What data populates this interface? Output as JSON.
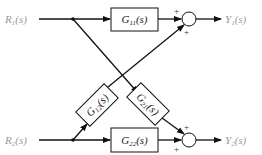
{
  "diagram": {
    "type": "block-diagram",
    "inputs": [
      {
        "id": "R1",
        "label": "R1(s)"
      },
      {
        "id": "R2",
        "label": "R2(s)"
      }
    ],
    "outputs": [
      {
        "id": "Y1",
        "label": "Y1(s)"
      },
      {
        "id": "Y2",
        "label": "Y2(s)"
      }
    ],
    "blocks": [
      {
        "id": "G11",
        "label": "G11(s)"
      },
      {
        "id": "G12",
        "label": "G12(s)"
      },
      {
        "id": "G21",
        "label": "G21(s)"
      },
      {
        "id": "G22",
        "label": "G22(s)"
      }
    ],
    "summing_junctions": [
      {
        "id": "S1",
        "signs": [
          "+",
          "+"
        ],
        "output": "Y1"
      },
      {
        "id": "S2",
        "signs": [
          "+",
          "+"
        ],
        "output": "Y2"
      }
    ],
    "connections": [
      "R1 -> G11 -> S1(+)",
      "R1 -> G21 -> S2(+)",
      "R2 -> G22 -> S2(+)",
      "R2 -> G12 -> S1(+)",
      "S1 -> Y1",
      "S2 -> Y2"
    ],
    "colors": {
      "line": "#111111",
      "label": "#9a9a9a"
    }
  }
}
